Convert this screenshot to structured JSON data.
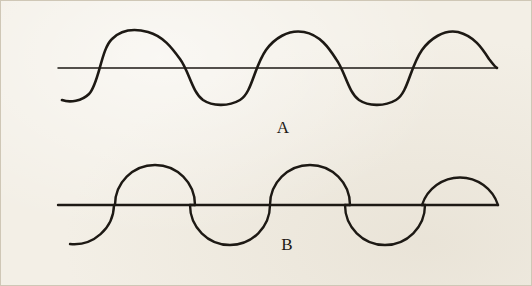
{
  "figure": {
    "kind": "scanned-textbook-figure",
    "background_color": "#f3efe6",
    "ink_color": "#1d1914",
    "border_color": "#cfc7b6",
    "panels": [
      {
        "id": "A",
        "label": "A",
        "label_x": 283,
        "label_y": 128,
        "description": "smooth sinusoidal wave crossing a straight horizontal axis line",
        "axis": {
          "y": 68,
          "x_start": 58,
          "x_end": 497
        },
        "wave": {
          "type": "sine",
          "amplitude": 36,
          "period": 156,
          "phase_start_x": 62,
          "phase_end_x": 497,
          "baseline_y": 68,
          "peaks_x": [
            148,
            304,
            458
          ],
          "troughs_x": [
            222,
            378
          ],
          "zero_crossings_x": [
            108,
            188,
            262,
            340,
            418,
            497
          ]
        }
      },
      {
        "id": "B",
        "label": "B",
        "label_x": 287,
        "label_y": 245,
        "description": "wave built from alternating half-circle arcs joined by straight chord segments along the axis",
        "axis": {
          "y": 205,
          "x_start": 58,
          "x_end": 498
        },
        "wave": {
          "type": "semicircle-train",
          "radius": 40,
          "baseline_y": 205,
          "arc_half_width": 40,
          "upper_arcs_center_x": [
            155,
            310,
            462
          ],
          "lower_arcs_center_x": [
            82,
            230,
            385
          ],
          "chord_segments": [
            {
              "x1": 58,
              "x2": 115
            },
            {
              "x1": 115,
              "x2": 195
            },
            {
              "x1": 190,
              "x2": 272
            },
            {
              "x1": 270,
              "x2": 350
            },
            {
              "x1": 345,
              "x2": 425
            },
            {
              "x1": 422,
              "x2": 498
            }
          ]
        }
      }
    ]
  },
  "chart_data": {
    "type": "line",
    "title": "",
    "xlabel": "",
    "ylabel": "",
    "grid": false,
    "legend": "none",
    "xlim": [
      0,
      532
    ],
    "ylim": [
      -1.1,
      1.1
    ],
    "series": [
      {
        "name": "A",
        "waveform": "sine",
        "amplitude": 1.0,
        "period_px": 156,
        "baseline_y_px": 68,
        "annotation": "A"
      },
      {
        "name": "B",
        "waveform": "semicircular (half-disc) alternating pulses",
        "amplitude": 1.0,
        "period_px": 156,
        "baseline_y_px": 205,
        "annotation": "B"
      }
    ]
  }
}
